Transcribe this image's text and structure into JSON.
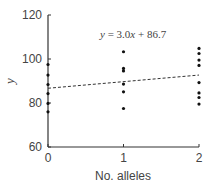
{
  "chart_data": {
    "type": "scatter",
    "title": "",
    "xlabel": "No. alleles",
    "ylabel": "y",
    "xlim": [
      0,
      2
    ],
    "ylim": [
      60,
      120
    ],
    "x_ticks": [
      "0",
      "1",
      "2"
    ],
    "y_ticks": [
      "60",
      "80",
      "100",
      "120"
    ],
    "grid": false,
    "legend": null,
    "series": [
      {
        "name": "observations",
        "points": [
          {
            "x": 0,
            "y": 97.5
          },
          {
            "x": 0,
            "y": 92.7
          },
          {
            "x": 0,
            "y": 88.4
          },
          {
            "x": 0,
            "y": 84.3
          },
          {
            "x": 0,
            "y": 79.8
          },
          {
            "x": 0,
            "y": 76.0
          },
          {
            "x": 1,
            "y": 103.3
          },
          {
            "x": 1,
            "y": 95.7
          },
          {
            "x": 1,
            "y": 94.6
          },
          {
            "x": 1,
            "y": 88.6
          },
          {
            "x": 1,
            "y": 85.1
          },
          {
            "x": 1,
            "y": 77.5
          },
          {
            "x": 2,
            "y": 104.8
          },
          {
            "x": 2,
            "y": 102.5
          },
          {
            "x": 2,
            "y": 99.5
          },
          {
            "x": 2,
            "y": 97.1
          },
          {
            "x": 2,
            "y": 89.3
          },
          {
            "x": 2,
            "y": 84.6
          },
          {
            "x": 2,
            "y": 82.5
          },
          {
            "x": 2,
            "y": 79.5
          }
        ]
      }
    ],
    "regression_line": {
      "style": "dashed",
      "slope": 3.0,
      "intercept": 86.7,
      "x_range": [
        0,
        2
      ]
    },
    "annotations": [
      {
        "text": "y = 3.0x + 86.7",
        "x": 1.0,
        "y": 110
      }
    ]
  },
  "labels": {
    "equation": "y = 3.0x + 86.7",
    "xlabel": "No. alleles",
    "ylabel": "y"
  }
}
